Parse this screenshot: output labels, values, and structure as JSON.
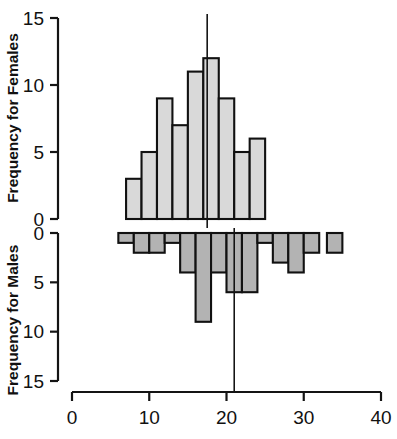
{
  "chart_data": {
    "type": "bar",
    "title": "",
    "subtitle": "",
    "xlabel": "",
    "ylabel_top": "Frequency for Females",
    "ylabel_bottom": "Frequency for Males",
    "orientation": "back-to-back histogram",
    "grid": false,
    "legend": "none",
    "x_axis": {
      "ticks": [
        0,
        10,
        20,
        30,
        40
      ],
      "ticklabels": [
        "0",
        "10",
        "20",
        "30",
        "40"
      ],
      "xlim": [
        0,
        40
      ]
    },
    "y_axis_top": {
      "ticks": [
        0,
        5,
        10,
        15
      ],
      "ticklabels": [
        "0",
        "5",
        "10",
        "15"
      ],
      "ylim": [
        0,
        15
      ],
      "direction": "up"
    },
    "y_axis_bottom": {
      "ticks": [
        0,
        5,
        10,
        15
      ],
      "ticklabels": [
        "0",
        "5",
        "10",
        "15"
      ],
      "ylim": [
        0,
        15
      ],
      "direction": "down"
    },
    "bin_width": 2,
    "series": [
      {
        "name": "Females",
        "panel": "top",
        "bin_starts": [
          7,
          9,
          11,
          13,
          15,
          17,
          19,
          21,
          23
        ],
        "bin_ends": [
          9,
          11,
          13,
          15,
          17,
          19,
          21,
          23,
          25
        ],
        "values": [
          3,
          5,
          9,
          7,
          11,
          12,
          9,
          5,
          6
        ],
        "fill": "#d9d9d9",
        "edge": "#111111"
      },
      {
        "name": "Males",
        "panel": "bottom",
        "bin_starts": [
          6,
          8,
          10,
          12,
          14,
          16,
          18,
          20,
          22,
          24,
          26,
          28,
          30,
          33
        ],
        "bin_ends": [
          8,
          10,
          12,
          14,
          16,
          18,
          20,
          22,
          24,
          26,
          28,
          30,
          32,
          35
        ],
        "values": [
          1,
          2,
          2,
          1,
          4,
          9,
          4,
          6,
          6,
          1,
          3,
          4,
          2,
          2
        ],
        "fill": "#b3b3b3",
        "edge": "#111111"
      }
    ],
    "annotations": [
      {
        "type": "vline",
        "panel": "top",
        "x": 17.5,
        "label": ""
      },
      {
        "type": "vline",
        "panel": "bottom",
        "x": 21.0,
        "label": ""
      }
    ]
  }
}
